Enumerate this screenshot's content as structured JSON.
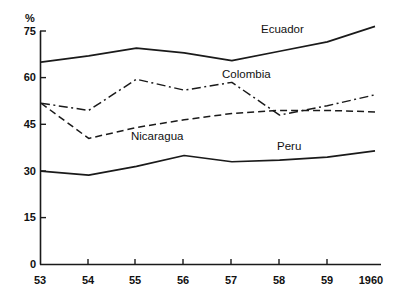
{
  "chart_data": {
    "type": "line",
    "title": "",
    "xlabel": "",
    "ylabel": "%",
    "x": [
      "53",
      "54",
      "55",
      "56",
      "57",
      "58",
      "59",
      "1960"
    ],
    "xlim": [
      1953,
      1960
    ],
    "ylim": [
      0,
      75
    ],
    "yticks": [
      0,
      15,
      30,
      45,
      60,
      75
    ],
    "ytick_labels": [
      "0",
      "15",
      "30",
      "45",
      "60",
      "75"
    ],
    "xtick_labels": [
      "53",
      "54",
      "55",
      "56",
      "57",
      "58",
      "59",
      "1960"
    ],
    "grid": false,
    "legend_position": "inline-annotations",
    "series": [
      {
        "name": "Ecuador",
        "style": "solid",
        "values": [
          65.0,
          67.0,
          69.5,
          68.0,
          65.5,
          68.5,
          71.5,
          76.5
        ]
      },
      {
        "name": "Colombia",
        "style": "dash-dot",
        "values": [
          51.8,
          49.5,
          59.5,
          56.0,
          58.5,
          48.0,
          51.0,
          54.5
        ]
      },
      {
        "name": "Nicaragua",
        "style": "dashed",
        "values": [
          51.8,
          40.5,
          44.0,
          46.5,
          48.5,
          49.5,
          49.5,
          49.0
        ]
      },
      {
        "name": "Peru",
        "style": "solid",
        "values": [
          30.0,
          28.7,
          31.5,
          35.0,
          33.0,
          33.5,
          34.5,
          36.5
        ]
      }
    ],
    "annotations": [
      {
        "text": "Ecuador",
        "series": "Ecuador"
      },
      {
        "text": "Colombia",
        "series": "Colombia"
      },
      {
        "text": "Nicaragua",
        "series": "Nicaragua"
      },
      {
        "text": "Peru",
        "series": "Peru"
      }
    ],
    "axis_color": "#1a1a1a",
    "line_color": "#1a1a1a"
  },
  "labels": {
    "y_unit": "%",
    "y_75": "75",
    "y_60": "60",
    "y_45": "45",
    "y_30": "30",
    "y_15": "15",
    "y_0": "0",
    "x_53": "53",
    "x_54": "54",
    "x_55": "55",
    "x_56": "56",
    "x_57": "57",
    "x_58": "58",
    "x_59": "59",
    "x_1960": "1960",
    "series_ecuador": "Ecuador",
    "series_colombia": "Colombia",
    "series_nicaragua": "Nicaragua",
    "series_peru": "Peru"
  }
}
